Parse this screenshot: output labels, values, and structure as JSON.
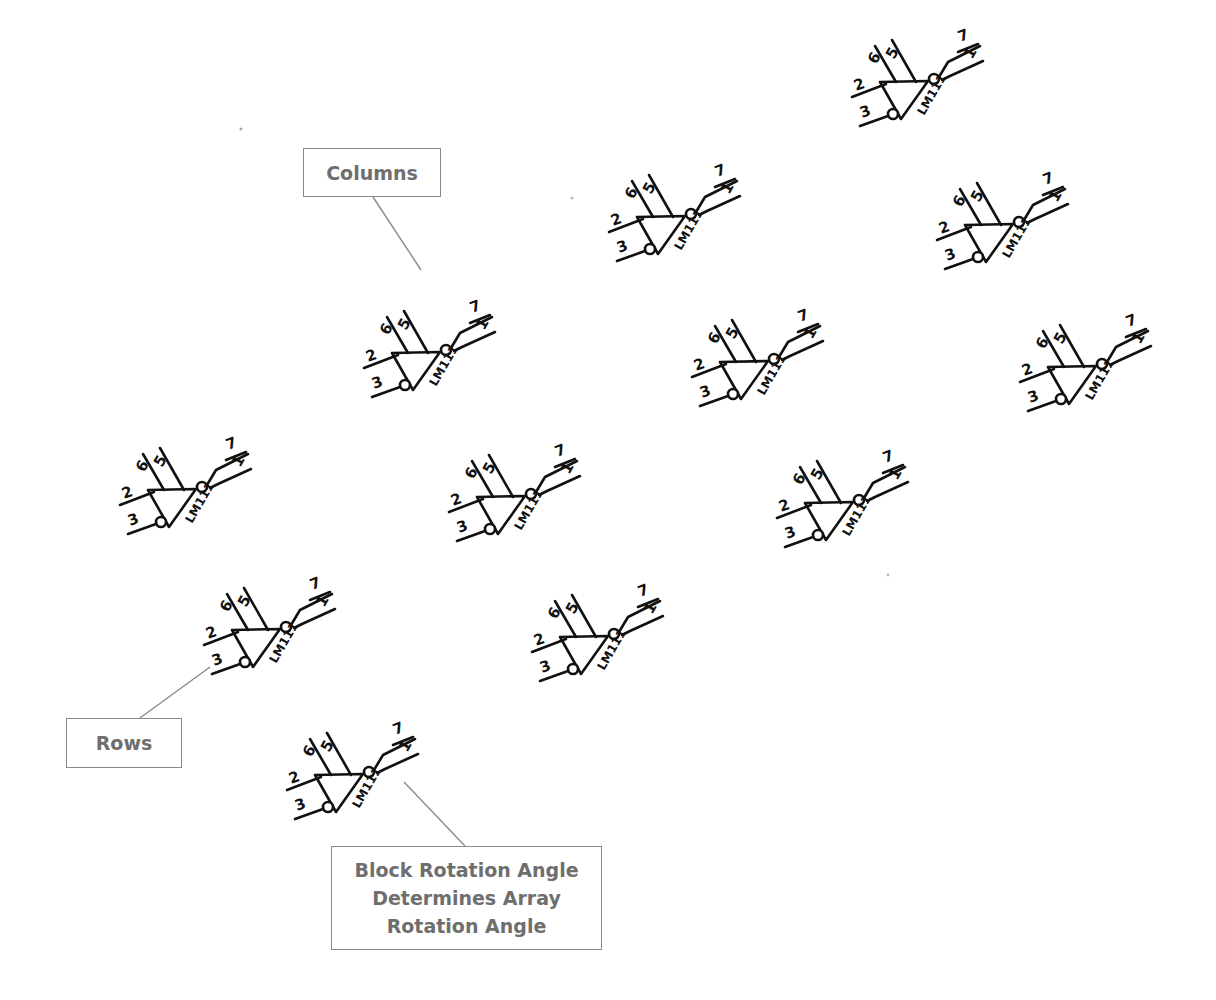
{
  "diagram": {
    "block": {
      "part_label": "LM111",
      "pins": {
        "in_plus": "2",
        "in_minus": "3",
        "bal_a": "6",
        "bal_b": "5",
        "out_a": "7",
        "out_b": "1"
      }
    },
    "instances": [
      {
        "x": 880,
        "y": 82
      },
      {
        "x": 637,
        "y": 217
      },
      {
        "x": 965,
        "y": 225
      },
      {
        "x": 392,
        "y": 353
      },
      {
        "x": 720,
        "y": 362
      },
      {
        "x": 1048,
        "y": 367
      },
      {
        "x": 148,
        "y": 490
      },
      {
        "x": 477,
        "y": 497
      },
      {
        "x": 805,
        "y": 503
      },
      {
        "x": 232,
        "y": 630
      },
      {
        "x": 560,
        "y": 637
      },
      {
        "x": 315,
        "y": 775
      }
    ],
    "callouts": {
      "columns": {
        "label": "Columns"
      },
      "rows": {
        "label": "Rows"
      },
      "block_rotation": {
        "line1": "Block Rotation Angle",
        "line2": "Determines Array",
        "line3": "Rotation Angle"
      }
    },
    "colors": {
      "symbol": "#111111",
      "callout_border": "#8a8a8a",
      "callout_text": "#6e6e6e",
      "leader": "#8a8a8a"
    }
  }
}
